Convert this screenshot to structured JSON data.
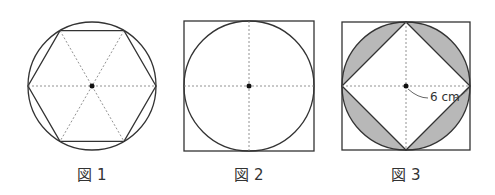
{
  "figures": [
    {
      "caption": "図 1",
      "shape": "regular hexagon inscribed in circle",
      "center": [
        92,
        86
      ],
      "radius": 64
    },
    {
      "caption": "図 2",
      "shape": "circle inscribed in square",
      "center": [
        249,
        86
      ],
      "radius": 65
    },
    {
      "caption": "図 3",
      "shape": "square inscribed in circle inscribed in square, shaded segments",
      "center": [
        406,
        86
      ],
      "radius": 64,
      "radius_label": "6 cm"
    }
  ],
  "colors": {
    "line": "#333333",
    "shade": "#b8b8b8",
    "dotted": "#777777"
  }
}
